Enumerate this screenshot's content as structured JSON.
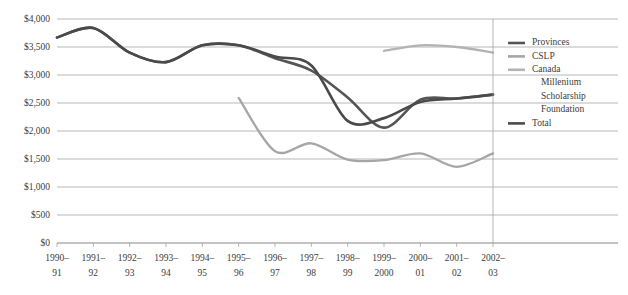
{
  "chart_data": {
    "type": "line",
    "title": "",
    "xlabel": "",
    "ylabel": "",
    "ylim": [
      0,
      4000
    ],
    "ytick_values": [
      0,
      500,
      1000,
      1500,
      2000,
      2500,
      3000,
      3500,
      4000
    ],
    "ytick_labels": [
      "$0",
      "$500",
      "$1,000",
      "$1,500",
      "$2,000",
      "$2,500",
      "$3,000",
      "$3,500",
      "$4,000"
    ],
    "grid": true,
    "legend_position": "right",
    "categories": [
      "1990–91",
      "1991–92",
      "1992–93",
      "1993–94",
      "1994–95",
      "1995–96",
      "1996–97",
      "1997–98",
      "1998–99",
      "1999–2000",
      "2000–01",
      "2001–02",
      "2002–03"
    ],
    "series": [
      {
        "name": "Provinces",
        "color": "#555555",
        "width": 2.6,
        "values": [
          3670,
          3840,
          3400,
          3230,
          3530,
          3530,
          3300,
          3080,
          2600,
          2060,
          2560,
          2580,
          2650
        ]
      },
      {
        "name": "CSLP",
        "color": "#a6a6a6",
        "width": 2.3,
        "values": [
          null,
          null,
          null,
          null,
          null,
          2590,
          1640,
          1780,
          1490,
          1480,
          1600,
          1360,
          1600
        ]
      },
      {
        "name": "Canada Millenium Scholarship Foundation",
        "color": "#b3b3b3",
        "width": 2.3,
        "values": [
          null,
          null,
          null,
          null,
          null,
          null,
          null,
          null,
          null,
          3430,
          3530,
          3500,
          3400
        ]
      },
      {
        "name": "Total",
        "color": "#4a4a4a",
        "width": 2.6,
        "values": [
          3670,
          3840,
          3400,
          3230,
          3530,
          3530,
          3330,
          3170,
          2180,
          2230,
          2520,
          2580,
          2650
        ]
      }
    ]
  },
  "legend": {
    "entries": [
      {
        "label": "Provinces",
        "color": "#555555"
      },
      {
        "label": "CSLP",
        "color": "#a6a6a6"
      },
      {
        "label": "Canada",
        "color": "#b3b3b3"
      },
      {
        "label": "Millenium",
        "color": ""
      },
      {
        "label": "Scholarship",
        "color": ""
      },
      {
        "label": "Foundation",
        "color": ""
      },
      {
        "label": "Total",
        "color": "#4a4a4a"
      }
    ]
  }
}
